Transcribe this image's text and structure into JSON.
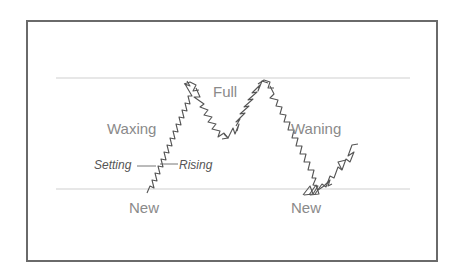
{
  "diagram": {
    "type": "moon-phase-tide-cycle",
    "labels": {
      "full": "Full",
      "waxing": "Waxing",
      "waning": "Waning",
      "new_left": "New",
      "new_right": "New",
      "setting": "Setting",
      "rising": "Rising"
    },
    "guides": {
      "top_line_y": 78,
      "bottom_line_y": 189,
      "color": "#c8c8c8"
    },
    "colors": {
      "frame": "#6a6a6a",
      "curve": "#555555",
      "label_text": "#8a8a8a",
      "annotation_text": "#555555"
    }
  }
}
